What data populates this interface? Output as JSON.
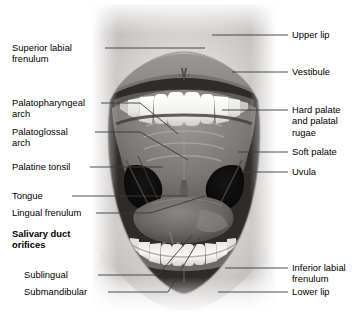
{
  "figure": {
    "style": "grayscale labeled anatomical photograph of an open mouth with leader lines"
  },
  "labels_left": [
    {
      "id": "superior-labial-frenulum",
      "text": "Superior labial\nfrenulum"
    },
    {
      "id": "palatopharyngeal-arch",
      "text": "Palatopharyngeal\narch"
    },
    {
      "id": "palatoglossal-arch",
      "text": "Palatoglossal\narch"
    },
    {
      "id": "palatine-tonsil",
      "text": "Palatine tonsil"
    },
    {
      "id": "tongue",
      "text": "Tongue"
    },
    {
      "id": "lingual-frenulum",
      "text": "Lingual frenulum"
    },
    {
      "id": "salivary-duct-orifices",
      "text": "Salivary duct\norifices"
    },
    {
      "id": "sublingual",
      "text": "Sublingual"
    },
    {
      "id": "submandibular",
      "text": "Submandibular"
    }
  ],
  "labels_right": [
    {
      "id": "upper-lip",
      "text": "Upper lip"
    },
    {
      "id": "vestibule",
      "text": "Vestibule"
    },
    {
      "id": "hard-palate",
      "text": "Hard palate\nand palatal\nrugae"
    },
    {
      "id": "soft-palate",
      "text": "Soft palate"
    },
    {
      "id": "uvula",
      "text": "Uvula"
    },
    {
      "id": "inferior-labial-frenulum",
      "text": "Inferior labial\nfrenulum"
    },
    {
      "id": "lower-lip",
      "text": "Lower lip"
    }
  ],
  "colors": {
    "line": "#3a3a3a",
    "text": "#000000",
    "background": "#ffffff"
  }
}
